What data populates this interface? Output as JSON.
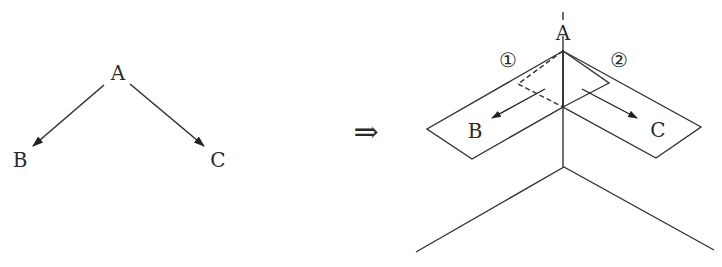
{
  "left_tree": {
    "nodes": {
      "root": "A",
      "left_child": "B",
      "right_child": "C"
    }
  },
  "transition": {
    "symbol": "⇒"
  },
  "right_diagram": {
    "apex_label": "A",
    "left_panel_label": "B",
    "right_panel_label": "C",
    "left_panel_marker": "①",
    "right_panel_marker": "②"
  },
  "colors": {
    "stroke": "#333333",
    "background": "#ffffff"
  }
}
